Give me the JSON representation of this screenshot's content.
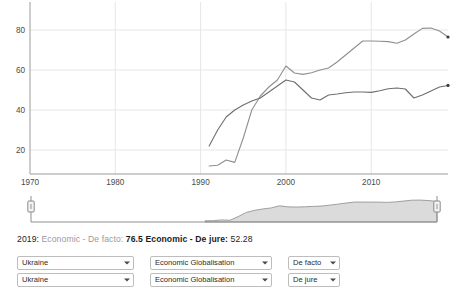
{
  "chart_data": {
    "type": "line",
    "title": "",
    "xlabel": "",
    "ylabel": "",
    "xlim": [
      1970,
      2019
    ],
    "ylim": [
      8,
      88
    ],
    "xticks": [
      1970,
      1980,
      1990,
      2000,
      2010
    ],
    "yticks": [
      20,
      40,
      60,
      80
    ],
    "grid": true,
    "legend_position": "below-chart-readout",
    "series": [
      {
        "name": "Economic - De facto",
        "color": "#8f8f8f",
        "x": [
          1991,
          1992,
          1993,
          1994,
          1995,
          1996,
          1997,
          1998,
          1999,
          2000,
          2001,
          2002,
          2003,
          2004,
          2005,
          2006,
          2007,
          2008,
          2009,
          2010,
          2011,
          2012,
          2013,
          2014,
          2015,
          2016,
          2017,
          2018,
          2019
        ],
        "values": [
          12.0,
          12.4,
          15.0,
          13.8,
          26.0,
          40.0,
          47.0,
          51.5,
          55.0,
          62.0,
          58.5,
          57.8,
          58.6,
          60.0,
          61.0,
          64.0,
          67.5,
          71.0,
          74.5,
          74.5,
          74.4,
          74.2,
          73.4,
          75.0,
          78.0,
          80.8,
          81.0,
          79.5,
          76.5
        ]
      },
      {
        "name": "Economic - De jure",
        "color": "#6e6e6e",
        "x": [
          1991,
          1992,
          1993,
          1994,
          1995,
          1996,
          1997,
          1998,
          1999,
          2000,
          2001,
          2002,
          2003,
          2004,
          2005,
          2006,
          2007,
          2008,
          2009,
          2010,
          2011,
          2012,
          2013,
          2014,
          2015,
          2016,
          2017,
          2018,
          2019
        ],
        "values": [
          22.0,
          30.0,
          36.5,
          40.0,
          42.5,
          44.5,
          46.0,
          49.0,
          52.0,
          55.0,
          54.0,
          50.0,
          46.0,
          45.0,
          47.5,
          48.0,
          48.6,
          49.0,
          49.0,
          48.8,
          49.6,
          50.6,
          51.0,
          50.5,
          46.0,
          47.5,
          49.5,
          51.5,
          52.28
        ]
      }
    ],
    "end_markers": [
      {
        "series": "Economic - De facto",
        "x": 2019,
        "y": 76.5
      },
      {
        "series": "Economic - De jure",
        "x": 2019,
        "y": 52.28
      }
    ]
  },
  "brush": {
    "name": "range-selector",
    "left_handle": "left-brush-handle",
    "right_handle": "right-brush-handle",
    "selection_start": 1970,
    "selection_end": 2019,
    "overview_fill": "#cfcfcf",
    "overview_stroke": "#8a8a8a"
  },
  "readout": {
    "year": "2019:",
    "series1_label": "Economic - De facto:",
    "series1_value": "76.5",
    "series2_label": "Economic - De jure:",
    "series2_value": "52.28"
  },
  "controls": {
    "rows": [
      {
        "country": "Ukraine",
        "dimension": "Economic Globalisation",
        "type": "De facto"
      },
      {
        "country": "Ukraine",
        "dimension": "Economic Globalisation",
        "type": "De jure"
      }
    ]
  },
  "colors": {
    "grid": "#e6e6ea",
    "axis": "#9b9b9b",
    "tick_text": "#4a4a4a",
    "series_de_facto": "#8f8f8f",
    "series_de_jure": "#6e6e6e",
    "background": "#ffffff"
  }
}
